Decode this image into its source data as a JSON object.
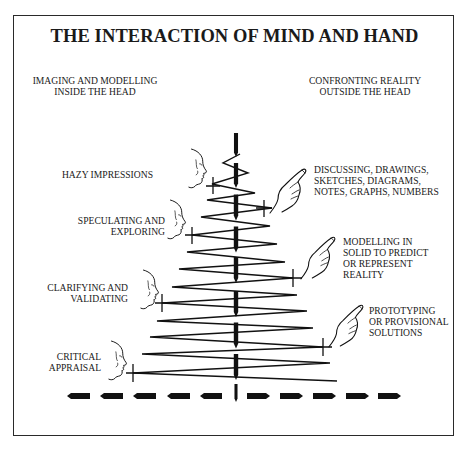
{
  "title": "THE INTERACTION OF MIND AND HAND",
  "column_headers": {
    "left": [
      "IMAGING AND MODELLING",
      "INSIDE THE HEAD"
    ],
    "right": [
      "CONFRONTING REALITY",
      "OUTSIDE THE HEAD"
    ]
  },
  "left_stages": [
    {
      "lines": [
        "HAZY IMPRESSIONS"
      ],
      "icon": "head-profile-icon"
    },
    {
      "lines": [
        "SPECULATING AND",
        "EXPLORING"
      ],
      "icon": "head-profile-icon"
    },
    {
      "lines": [
        "CLARIFYING AND",
        "VALIDATING"
      ],
      "icon": "head-profile-icon"
    },
    {
      "lines": [
        "CRITICAL",
        "APPRAISAL"
      ],
      "icon": "head-profile-icon"
    }
  ],
  "right_stages": [
    {
      "lines": [
        "DISCUSSING, DRAWINGS,",
        "SKETCHES, DIAGRAMS,",
        "NOTES, GRAPHS, NUMBERS"
      ],
      "icon": "pointing-hand-icon"
    },
    {
      "lines": [
        "MODELLING IN",
        "SOLID TO PREDICT",
        "OR REPRESENT",
        "REALITY"
      ],
      "icon": "pointing-hand-icon"
    },
    {
      "lines": [
        "PROTOTYPING",
        "OR PROVISIONAL",
        "SOLUTIONS"
      ],
      "icon": "pointing-hand-icon"
    }
  ],
  "colors": {
    "ink": "#1a1a1a",
    "background": "#ffffff",
    "frame": "#2a2a2a"
  }
}
